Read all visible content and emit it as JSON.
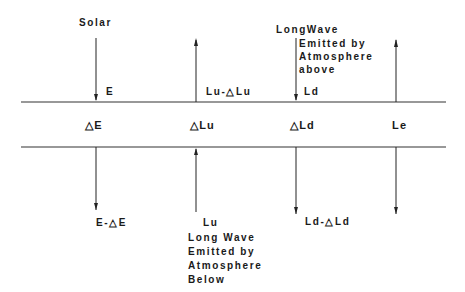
{
  "diagram": {
    "layers": {
      "top_line_y": 102,
      "bottom_line_y": 147
    },
    "columns": [
      {
        "id": "solar",
        "header": "Solar",
        "top_label": "E",
        "mid_label": "△E",
        "bottom_label": "E-△E",
        "direction": "down"
      },
      {
        "id": "longwave-up",
        "top_label": "Lu-△Lu",
        "mid_label": "△Lu",
        "bottom_label": "Lu",
        "bottom_note": [
          "Long Wave",
          "Emitted by",
          "Atmosphere",
          "Below"
        ],
        "direction": "up"
      },
      {
        "id": "longwave-down",
        "header_lines": [
          "LongWave",
          "Emitted by",
          "Atmosphere",
          "above"
        ],
        "top_label": "Ld",
        "mid_label": "△Ld",
        "bottom_label": "Ld-△Ld",
        "direction": "down"
      },
      {
        "id": "emitted",
        "mid_label": "Le",
        "direction": "both"
      }
    ]
  }
}
